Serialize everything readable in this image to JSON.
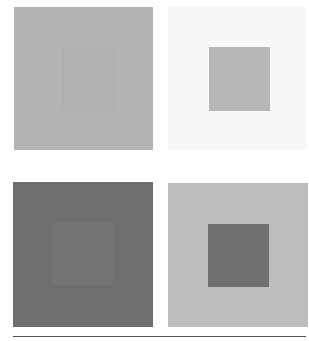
{
  "figure": {
    "panels": [
      {
        "name": "top-left",
        "outer_color": "#b4b4b4",
        "inner_color": "#b1b1b1",
        "outer": [
          14,
          7,
          139,
          143
        ],
        "inner": [
          62,
          47,
          54,
          64
        ]
      },
      {
        "name": "top-right",
        "outer_color": "#f8f8f8",
        "inner_color": "#b7b7b7",
        "outer": [
          168,
          7,
          139,
          143
        ],
        "inner": [
          209,
          47,
          61,
          64
        ]
      },
      {
        "name": "bottom-left",
        "outer_color": "#6e6e6e",
        "inner_color": "#747474",
        "outer": [
          13,
          182,
          140,
          145
        ],
        "inner": [
          52,
          223,
          61,
          62
        ]
      },
      {
        "name": "bottom-right",
        "outer_color": "#bdbdbd",
        "inner_color": "#707070",
        "outer": [
          168,
          183,
          140,
          144
        ],
        "inner": [
          208,
          224,
          61,
          63
        ]
      }
    ],
    "rule_color": "#555555"
  }
}
